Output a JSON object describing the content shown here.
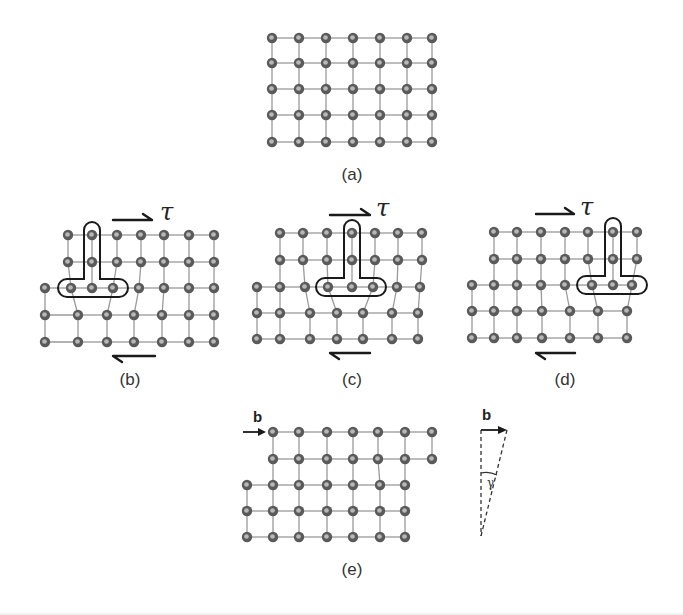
{
  "figure": {
    "atom_radius": 5.2,
    "colors": {
      "atom": "#5a5a5a",
      "atom_highlight": "#b8b8b8",
      "bond": "#9a9a9a",
      "ink": "#1a1a1a"
    },
    "shear_symbol": "τ",
    "burgers_symbol": "b",
    "angle_symbol": "γ"
  },
  "panels": [
    {
      "id": "a",
      "label": "(a)",
      "label_pos": [
        352,
        180
      ],
      "rows": [
        {
          "y": 38,
          "x": [
            272,
            299,
            326,
            353,
            380,
            407,
            432
          ]
        },
        {
          "y": 63,
          "x": [
            272,
            299,
            326,
            353,
            380,
            407,
            432
          ]
        },
        {
          "y": 89,
          "x": [
            272,
            299,
            326,
            353,
            380,
            407,
            432
          ]
        },
        {
          "y": 115,
          "x": [
            272,
            299,
            326,
            353,
            380,
            407,
            432
          ]
        },
        {
          "y": 142,
          "x": [
            272,
            299,
            326,
            353,
            380,
            407,
            432
          ]
        }
      ],
      "vertical_links": [
        [
          0,
          1,
          "all"
        ],
        [
          1,
          2,
          "all"
        ],
        [
          2,
          3,
          "all"
        ],
        [
          3,
          4,
          "all"
        ]
      ]
    },
    {
      "id": "b",
      "label": "(b)",
      "label_pos": [
        130,
        385
      ],
      "rows": [
        {
          "y": 235,
          "x": [
            68,
            92,
            117,
            141,
            164,
            189,
            214
          ]
        },
        {
          "y": 262,
          "x": [
            68,
            92,
            117,
            141,
            164,
            189,
            214
          ]
        },
        {
          "y": 288,
          "x": [
            45,
            71,
            92,
            113,
            139,
            164,
            189,
            214
          ]
        },
        {
          "y": 315,
          "x": [
            45,
            78,
            107,
            134,
            162,
            189,
            214
          ]
        },
        {
          "y": 342,
          "x": [
            45,
            78,
            107,
            134,
            162,
            189,
            214
          ]
        }
      ],
      "vertical_links": [
        [
          0,
          1,
          [
            [
              0,
              0
            ],
            [
              1,
              1
            ],
            [
              2,
              2
            ],
            [
              3,
              3
            ],
            [
              4,
              4
            ],
            [
              5,
              5
            ],
            [
              6,
              6
            ]
          ]
        ],
        [
          1,
          2,
          [
            [
              0,
              1
            ],
            [
              1,
              2
            ],
            [
              2,
              3
            ],
            [
              3,
              4
            ],
            [
              4,
              5
            ],
            [
              5,
              6
            ],
            [
              6,
              7
            ]
          ]
        ],
        [
          2,
          3,
          [
            [
              0,
              0
            ],
            [
              1,
              1
            ],
            [
              3,
              2
            ],
            [
              4,
              3
            ],
            [
              5,
              4
            ],
            [
              6,
              5
            ],
            [
              7,
              6
            ]
          ]
        ],
        [
          3,
          4,
          "all"
        ]
      ],
      "dislocation": {
        "stem_x": 92,
        "stem_top": 222,
        "bar_y": 288,
        "bar_left": 58,
        "bar_right": 128,
        "bar_half": 9,
        "stem_half": 8
      },
      "top_arrow": {
        "x1": 113,
        "x2": 152,
        "y": 220
      },
      "bottom_arrow": {
        "x1": 113,
        "x2": 155,
        "y": 356
      },
      "tau_pos": [
        160,
        220
      ]
    },
    {
      "id": "c",
      "label": "(c)",
      "label_pos": [
        352,
        385
      ],
      "rows": [
        {
          "y": 233,
          "x": [
            280,
            303,
            327,
            352,
            375,
            398,
            422
          ]
        },
        {
          "y": 260,
          "x": [
            280,
            303,
            327,
            352,
            375,
            398,
            422
          ]
        },
        {
          "y": 287,
          "x": [
            257,
            280,
            305,
            328,
            352,
            373,
            397,
            420
          ]
        },
        {
          "y": 313,
          "x": [
            257,
            280,
            310,
            337,
            363,
            392,
            418
          ]
        },
        {
          "y": 339,
          "x": [
            257,
            280,
            310,
            337,
            363,
            392,
            418
          ]
        }
      ],
      "vertical_links": [
        [
          0,
          1,
          [
            [
              0,
              0
            ],
            [
              1,
              1
            ],
            [
              2,
              2
            ],
            [
              3,
              3
            ],
            [
              4,
              4
            ],
            [
              5,
              5
            ],
            [
              6,
              6
            ]
          ]
        ],
        [
          1,
          2,
          [
            [
              0,
              1
            ],
            [
              1,
              2
            ],
            [
              2,
              3
            ],
            [
              3,
              4
            ],
            [
              4,
              5
            ],
            [
              5,
              6
            ],
            [
              6,
              7
            ]
          ]
        ],
        [
          2,
          3,
          [
            [
              0,
              0
            ],
            [
              1,
              1
            ],
            [
              2,
              2
            ],
            [
              3,
              3
            ],
            [
              5,
              4
            ],
            [
              6,
              5
            ],
            [
              7,
              6
            ]
          ]
        ],
        [
          3,
          4,
          "all"
        ]
      ],
      "dislocation": {
        "stem_x": 352,
        "stem_top": 220,
        "bar_y": 287,
        "bar_left": 316,
        "bar_right": 386,
        "bar_half": 9,
        "stem_half": 8
      },
      "top_arrow": {
        "x1": 330,
        "x2": 370,
        "y": 215
      },
      "bottom_arrow": {
        "x1": 330,
        "x2": 370,
        "y": 353
      },
      "tau_pos": [
        376,
        216
      ]
    },
    {
      "id": "d",
      "label": "(d)",
      "label_pos": [
        565,
        385
      ],
      "rows": [
        {
          "y": 232,
          "x": [
            494,
            517,
            541,
            565,
            588,
            613,
            637
          ]
        },
        {
          "y": 259,
          "x": [
            494,
            517,
            541,
            565,
            588,
            613,
            637
          ]
        },
        {
          "y": 285,
          "x": [
            472,
            494,
            517,
            541,
            565,
            592,
            613,
            632
          ]
        },
        {
          "y": 311,
          "x": [
            472,
            494,
            517,
            542,
            570,
            598,
            627
          ]
        },
        {
          "y": 338,
          "x": [
            472,
            494,
            517,
            542,
            570,
            598,
            627
          ]
        }
      ],
      "vertical_links": [
        [
          0,
          1,
          [
            [
              0,
              0
            ],
            [
              1,
              1
            ],
            [
              2,
              2
            ],
            [
              3,
              3
            ],
            [
              4,
              4
            ],
            [
              5,
              5
            ],
            [
              6,
              6
            ]
          ]
        ],
        [
          1,
          2,
          [
            [
              0,
              1
            ],
            [
              1,
              2
            ],
            [
              2,
              3
            ],
            [
              3,
              4
            ],
            [
              4,
              5
            ],
            [
              5,
              6
            ],
            [
              6,
              7
            ]
          ]
        ],
        [
          2,
          3,
          [
            [
              0,
              0
            ],
            [
              1,
              1
            ],
            [
              2,
              2
            ],
            [
              3,
              3
            ],
            [
              4,
              4
            ],
            [
              5,
              5
            ],
            [
              7,
              6
            ]
          ]
        ],
        [
          3,
          4,
          "all"
        ]
      ],
      "dislocation": {
        "stem_x": 613,
        "stem_top": 218,
        "bar_y": 285,
        "bar_left": 577,
        "bar_right": 647,
        "bar_half": 9,
        "stem_half": 8
      },
      "top_arrow": {
        "x1": 536,
        "x2": 574,
        "y": 214
      },
      "bottom_arrow": {
        "x1": 536,
        "x2": 575,
        "y": 353
      },
      "tau_pos": [
        580,
        215
      ]
    },
    {
      "id": "e",
      "label": "(e)",
      "label_pos": [
        352,
        575
      ],
      "rows": [
        {
          "y": 432,
          "x": [
            273,
            299,
            327,
            353,
            378,
            405,
            432
          ]
        },
        {
          "y": 459,
          "x": [
            273,
            299,
            327,
            353,
            378,
            405,
            432
          ]
        },
        {
          "y": 485,
          "x": [
            247,
            273,
            299,
            327,
            353,
            380,
            405
          ]
        },
        {
          "y": 511,
          "x": [
            247,
            273,
            299,
            327,
            353,
            380,
            405
          ]
        },
        {
          "y": 537,
          "x": [
            247,
            273,
            299,
            327,
            353,
            380,
            405
          ]
        }
      ],
      "vertical_links": [
        [
          0,
          1,
          "all"
        ],
        [
          1,
          2,
          [
            [
              0,
              1
            ],
            [
              1,
              2
            ],
            [
              2,
              3
            ],
            [
              3,
              4
            ],
            [
              4,
              5
            ],
            [
              5,
              6
            ]
          ]
        ],
        [
          2,
          3,
          "all"
        ],
        [
          3,
          4,
          "all"
        ]
      ],
      "burgers_arrow": {
        "x1": 243,
        "x2": 266,
        "y": 432,
        "label_pos": [
          253,
          422
        ]
      }
    }
  ],
  "burgers_triangle": {
    "top_left": [
      481,
      430
    ],
    "top_right": [
      507,
      430
    ],
    "apex": [
      481,
      536
    ],
    "label_pos": [
      482,
      420
    ],
    "gamma_pos": [
      487,
      487
    ],
    "arc_y": 474
  }
}
